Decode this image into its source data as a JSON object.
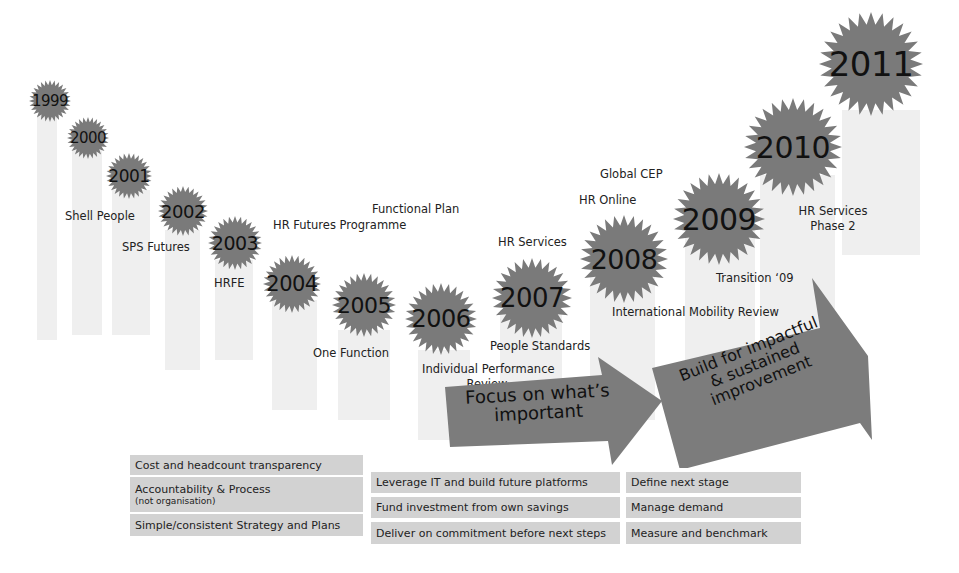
{
  "timeline": {
    "years": [
      {
        "year": "1999"
      },
      {
        "year": "2000"
      },
      {
        "year": "2001"
      },
      {
        "year": "2002"
      },
      {
        "year": "2003"
      },
      {
        "year": "2004"
      },
      {
        "year": "2005"
      },
      {
        "year": "2006"
      },
      {
        "year": "2007"
      },
      {
        "year": "2008"
      },
      {
        "year": "2009"
      },
      {
        "year": "2010"
      },
      {
        "year": "2011"
      }
    ],
    "milestones": [
      {
        "text": "Shell People"
      },
      {
        "text": "SPS Futures"
      },
      {
        "text": "HRFE"
      },
      {
        "text": "HR Futures Programme"
      },
      {
        "text": "Functional Plan"
      },
      {
        "text": "One Function"
      },
      {
        "text": "Individual Performance",
        "text2": "Review"
      },
      {
        "text": "HR Services"
      },
      {
        "text": "People Standards"
      },
      {
        "text": "HR Online"
      },
      {
        "text": "Global CEP"
      },
      {
        "text": "International Mobility Review"
      },
      {
        "text": "Transition ‘09"
      },
      {
        "text": "HR Services",
        "text2": "Phase 2"
      }
    ]
  },
  "arrows": {
    "focus": {
      "line1": "Focus on what’s",
      "line2": "important"
    },
    "build": {
      "line1": "Build for impactful",
      "line2": "& sustained",
      "line3": "improvement"
    }
  },
  "principles": {
    "column1": [
      {
        "text": "Cost and headcount transparency"
      },
      {
        "text": "Accountability & Process",
        "sub": "(not organisation)"
      },
      {
        "text": "Simple/consistent Strategy and Plans"
      }
    ],
    "column2": [
      {
        "text": "Leverage IT and build future platforms"
      },
      {
        "text": "Fund investment from own savings"
      },
      {
        "text": "Deliver on commitment before next steps"
      }
    ],
    "column3": [
      {
        "text": "Define next stage"
      },
      {
        "text": "Manage demand"
      },
      {
        "text": "Measure and benchmark"
      }
    ]
  },
  "colors": {
    "burst": "#7a7a7a",
    "arrow": "#7c7c7c",
    "box": "#d2d2d2",
    "bar": "#efefef"
  }
}
